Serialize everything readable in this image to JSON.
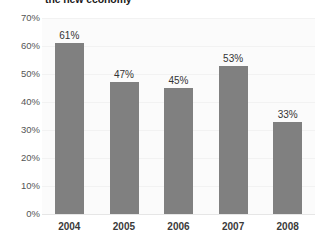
{
  "chart_data": {
    "type": "bar",
    "title": "the new economy",
    "xlabel": "",
    "ylabel": "",
    "categories": [
      "2004",
      "2005",
      "2006",
      "2007",
      "2008"
    ],
    "values": [
      61,
      47,
      45,
      53,
      33
    ],
    "data_labels": [
      "61%",
      "47%",
      "45%",
      "53%",
      "33%"
    ],
    "ylim": [
      0,
      70
    ],
    "ytick_values": [
      70,
      60,
      50,
      40,
      30,
      20,
      10,
      0
    ],
    "ytick_labels": [
      "70%",
      "60%",
      "50%",
      "40%",
      "30%",
      "20%",
      "10%",
      "0%"
    ],
    "grid": true,
    "legend": null,
    "colors": {
      "bar": "#808080",
      "background": "#ffffff",
      "plot_background": "#fbfbfb",
      "gridline": "#f2f2f2",
      "axis": "#e6e6e6",
      "tick_label": "#555555",
      "category_label": "#3a3a3a",
      "data_label": "#333333",
      "title": "#1a1a1a"
    }
  }
}
